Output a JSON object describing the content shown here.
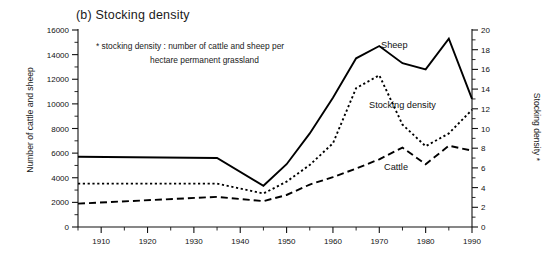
{
  "figure": {
    "panel_title": "(b)  Stocking density",
    "note_line1": "* stocking density : number of cattle and sheep per",
    "note_line2": "hectare permanent grassland",
    "ylabel_left": "Number of cattle and sheep",
    "ylabel_right": "Stocking density *",
    "label_sheep": "Sheep",
    "label_density": "Stocking density",
    "label_cattle": "Cattle"
  },
  "chart_data": {
    "type": "line",
    "title": "(b)  Stocking density",
    "xlabel": "",
    "ylabel": "Number of cattle and sheep",
    "ylabel_secondary": "Stocking density *",
    "xlim": [
      1905,
      1990
    ],
    "ylim": [
      0,
      16000
    ],
    "ylim_secondary": [
      0,
      20
    ],
    "grid": false,
    "legend": "inline-annotations",
    "xticks": [
      1910,
      1920,
      1930,
      1940,
      1950,
      1960,
      1970,
      1980,
      1990
    ],
    "xticks_minor": [
      1905,
      1915,
      1925,
      1935,
      1945,
      1955,
      1965,
      1975,
      1985
    ],
    "yticks": [
      0,
      2000,
      4000,
      6000,
      8000,
      10000,
      12000,
      14000,
      16000
    ],
    "yticks_minor": [
      1000,
      3000,
      5000,
      7000,
      9000,
      11000,
      13000,
      15000
    ],
    "yticks_secondary": [
      0,
      2,
      4,
      6,
      8,
      10,
      12,
      14,
      16,
      18,
      20
    ],
    "yticks_secondary_minor": [
      1,
      3,
      5,
      7,
      9,
      11,
      13,
      15,
      17,
      19
    ],
    "x": [
      1905,
      1935,
      1945,
      1950,
      1955,
      1960,
      1965,
      1970,
      1975,
      1980,
      1985,
      1990
    ],
    "series": [
      {
        "name": "Sheep",
        "style": "solid",
        "axis": "left",
        "values": [
          5700,
          5600,
          3350,
          5100,
          7600,
          10500,
          13700,
          14700,
          13300,
          12800,
          15300,
          10400
        ]
      },
      {
        "name": "Stocking density",
        "style": "dotted",
        "axis": "right",
        "values": [
          4.4,
          4.4,
          3.4,
          4.6,
          6.3,
          8.5,
          14.1,
          15.4,
          10.4,
          8.2,
          9.5,
          11.9
        ]
      },
      {
        "name": "Cattle",
        "style": "dashed",
        "axis": "left",
        "values": [
          1900,
          2450,
          2100,
          2600,
          3450,
          4050,
          4750,
          5500,
          6450,
          5100,
          6600,
          6200
        ]
      }
    ]
  }
}
